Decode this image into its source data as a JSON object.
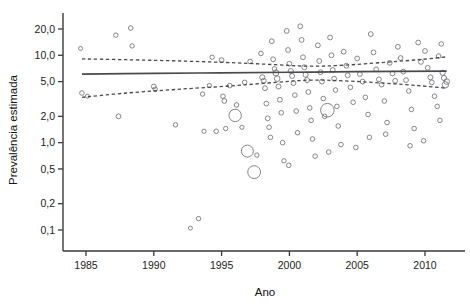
{
  "chart_data": {
    "type": "scatter",
    "title": "",
    "subtitle": "",
    "xlabel": "Ano",
    "ylabel": "Prevalência estimada",
    "yscale": "log",
    "xscale": "linear",
    "xlim": [
      1984.0,
      1984.0
    ],
    "ylim": [
      0.07,
      26.0
    ],
    "grid": false,
    "legend": null,
    "legend_position": "none",
    "xticks": [
      1985,
      1990,
      1995,
      2000,
      2005,
      2010
    ],
    "xticklabels": [
      "1985",
      "1990",
      "1995",
      "2000",
      "2005",
      "2010"
    ],
    "yticks": [
      20.0,
      10.0,
      5.0,
      2.0,
      1.0,
      0.5,
      0.2,
      0.1
    ],
    "yticklabels": [
      "20,0",
      "10,0",
      "5,0",
      "2,0",
      "1,0",
      "0,5",
      "0,2",
      "0,1"
    ],
    "marker": "open-circle",
    "marker_color": "#6f7077",
    "annotations": [],
    "points": [
      {
        "x": 1984.6,
        "y": 12.0,
        "r": 2.0
      },
      {
        "x": 1984.7,
        "y": 3.7,
        "r": 2.3
      },
      {
        "x": 1985.1,
        "y": 3.4,
        "r": 2.0
      },
      {
        "x": 1987.2,
        "y": 17.0,
        "r": 2.2
      },
      {
        "x": 1987.4,
        "y": 2.0,
        "r": 2.4
      },
      {
        "x": 1988.3,
        "y": 20.5,
        "r": 2.3
      },
      {
        "x": 1988.4,
        "y": 12.8,
        "r": 2.2
      },
      {
        "x": 1990.0,
        "y": 4.4,
        "r": 2.4
      },
      {
        "x": 1990.1,
        "y": 4.1,
        "r": 2.2
      },
      {
        "x": 1991.6,
        "y": 1.6,
        "r": 2.2
      },
      {
        "x": 1992.7,
        "y": 0.105,
        "r": 2.0
      },
      {
        "x": 1993.3,
        "y": 0.135,
        "r": 2.2
      },
      {
        "x": 1993.6,
        "y": 3.6,
        "r": 2.2
      },
      {
        "x": 1993.7,
        "y": 1.35,
        "r": 2.1
      },
      {
        "x": 1994.1,
        "y": 4.5,
        "r": 2.2
      },
      {
        "x": 1994.6,
        "y": 1.35,
        "r": 2.3
      },
      {
        "x": 1995.0,
        "y": 8.8,
        "r": 2.4
      },
      {
        "x": 1995.1,
        "y": 3.4,
        "r": 2.3
      },
      {
        "x": 1995.2,
        "y": 3.0,
        "r": 2.4
      },
      {
        "x": 1995.3,
        "y": 1.45,
        "r": 2.2
      },
      {
        "x": 1995.6,
        "y": 4.5,
        "r": 2.3
      },
      {
        "x": 1996.0,
        "y": 2.05,
        "r": 6.2
      },
      {
        "x": 1996.1,
        "y": 2.7,
        "r": 2.3
      },
      {
        "x": 1996.5,
        "y": 1.5,
        "r": 2.1
      },
      {
        "x": 1996.9,
        "y": 0.8,
        "r": 6.0
      },
      {
        "x": 1997.1,
        "y": 8.5,
        "r": 2.3
      },
      {
        "x": 1997.4,
        "y": 0.46,
        "r": 6.4
      },
      {
        "x": 1997.6,
        "y": 0.72,
        "r": 2.2
      },
      {
        "x": 1997.9,
        "y": 10.5,
        "r": 2.3
      },
      {
        "x": 1998.0,
        "y": 5.6,
        "r": 2.6
      },
      {
        "x": 1998.1,
        "y": 5.1,
        "r": 2.5
      },
      {
        "x": 1998.2,
        "y": 4.2,
        "r": 2.4
      },
      {
        "x": 1998.3,
        "y": 2.8,
        "r": 2.4
      },
      {
        "x": 1998.4,
        "y": 1.9,
        "r": 2.4
      },
      {
        "x": 1998.5,
        "y": 1.5,
        "r": 2.3
      },
      {
        "x": 1998.6,
        "y": 1.15,
        "r": 2.3
      },
      {
        "x": 1998.7,
        "y": 14.5,
        "r": 2.4
      },
      {
        "x": 1998.8,
        "y": 9.0,
        "r": 2.4
      },
      {
        "x": 1998.9,
        "y": 7.0,
        "r": 2.3
      },
      {
        "x": 1999.0,
        "y": 6.3,
        "r": 3.0
      },
      {
        "x": 1999.1,
        "y": 5.4,
        "r": 2.8
      },
      {
        "x": 1999.2,
        "y": 4.4,
        "r": 2.5
      },
      {
        "x": 1999.3,
        "y": 3.1,
        "r": 2.4
      },
      {
        "x": 1999.4,
        "y": 2.2,
        "r": 2.3
      },
      {
        "x": 1999.5,
        "y": 1.0,
        "r": 2.3
      },
      {
        "x": 1999.6,
        "y": 0.62,
        "r": 2.2
      },
      {
        "x": 1999.8,
        "y": 19.0,
        "r": 2.4
      },
      {
        "x": 1999.9,
        "y": 11.5,
        "r": 2.4
      },
      {
        "x": 2000.0,
        "y": 8.0,
        "r": 2.4
      },
      {
        "x": 2000.1,
        "y": 6.6,
        "r": 2.6
      },
      {
        "x": 2000.2,
        "y": 5.8,
        "r": 2.5
      },
      {
        "x": 2000.3,
        "y": 4.8,
        "r": 2.4
      },
      {
        "x": 2000.4,
        "y": 3.5,
        "r": 2.3
      },
      {
        "x": 2000.5,
        "y": 2.3,
        "r": 2.3
      },
      {
        "x": 2000.6,
        "y": 1.3,
        "r": 2.3
      },
      {
        "x": 2000.8,
        "y": 21.5,
        "r": 2.4
      },
      {
        "x": 2000.9,
        "y": 15.0,
        "r": 2.4
      },
      {
        "x": 2001.0,
        "y": 9.5,
        "r": 2.4
      },
      {
        "x": 2001.1,
        "y": 7.3,
        "r": 2.5
      },
      {
        "x": 2001.2,
        "y": 6.0,
        "r": 2.5
      },
      {
        "x": 2001.3,
        "y": 5.2,
        "r": 2.5
      },
      {
        "x": 2001.4,
        "y": 3.8,
        "r": 2.4
      },
      {
        "x": 2001.5,
        "y": 2.5,
        "r": 2.3
      },
      {
        "x": 2001.6,
        "y": 1.8,
        "r": 2.3
      },
      {
        "x": 2001.7,
        "y": 1.1,
        "r": 2.3
      },
      {
        "x": 2002.1,
        "y": 13.0,
        "r": 2.4
      },
      {
        "x": 2002.2,
        "y": 8.6,
        "r": 2.4
      },
      {
        "x": 2002.3,
        "y": 6.4,
        "r": 2.4
      },
      {
        "x": 2002.4,
        "y": 5.0,
        "r": 2.4
      },
      {
        "x": 2002.5,
        "y": 3.2,
        "r": 2.3
      },
      {
        "x": 2002.6,
        "y": 2.0,
        "r": 2.3
      },
      {
        "x": 2002.8,
        "y": 2.35,
        "r": 6.8
      },
      {
        "x": 2003.0,
        "y": 16.0,
        "r": 2.4
      },
      {
        "x": 2003.1,
        "y": 10.0,
        "r": 2.4
      },
      {
        "x": 2003.2,
        "y": 6.8,
        "r": 2.4
      },
      {
        "x": 2003.3,
        "y": 5.4,
        "r": 2.4
      },
      {
        "x": 2003.4,
        "y": 4.0,
        "r": 2.3
      },
      {
        "x": 2003.5,
        "y": 2.6,
        "r": 2.3
      },
      {
        "x": 2003.6,
        "y": 1.55,
        "r": 2.3
      },
      {
        "x": 2003.8,
        "y": 0.95,
        "r": 2.3
      },
      {
        "x": 2004.0,
        "y": 11.0,
        "r": 2.4
      },
      {
        "x": 2004.2,
        "y": 7.6,
        "r": 2.4
      },
      {
        "x": 2004.3,
        "y": 5.9,
        "r": 2.4
      },
      {
        "x": 2004.5,
        "y": 4.3,
        "r": 2.3
      },
      {
        "x": 2004.7,
        "y": 2.9,
        "r": 2.3
      },
      {
        "x": 2005.0,
        "y": 9.2,
        "r": 2.4
      },
      {
        "x": 2005.2,
        "y": 6.1,
        "r": 2.4
      },
      {
        "x": 2005.4,
        "y": 5.0,
        "r": 2.4
      },
      {
        "x": 2005.6,
        "y": 3.3,
        "r": 2.3
      },
      {
        "x": 2005.8,
        "y": 2.1,
        "r": 2.3
      },
      {
        "x": 2006.0,
        "y": 17.5,
        "r": 2.4
      },
      {
        "x": 2006.2,
        "y": 10.8,
        "r": 2.4
      },
      {
        "x": 2006.4,
        "y": 6.9,
        "r": 2.4
      },
      {
        "x": 2006.6,
        "y": 5.3,
        "r": 2.4
      },
      {
        "x": 2006.8,
        "y": 4.6,
        "r": 2.3
      },
      {
        "x": 2007.0,
        "y": 3.0,
        "r": 2.3
      },
      {
        "x": 2007.2,
        "y": 1.7,
        "r": 2.3
      },
      {
        "x": 2007.4,
        "y": 8.2,
        "r": 2.4
      },
      {
        "x": 2007.6,
        "y": 6.2,
        "r": 2.4
      },
      {
        "x": 2007.8,
        "y": 5.1,
        "r": 2.4
      },
      {
        "x": 2008.0,
        "y": 12.5,
        "r": 2.4
      },
      {
        "x": 2008.2,
        "y": 9.3,
        "r": 2.4
      },
      {
        "x": 2008.4,
        "y": 6.5,
        "r": 2.4
      },
      {
        "x": 2008.6,
        "y": 5.2,
        "r": 2.4
      },
      {
        "x": 2008.8,
        "y": 3.9,
        "r": 2.3
      },
      {
        "x": 2009.0,
        "y": 2.4,
        "r": 2.3
      },
      {
        "x": 2009.2,
        "y": 1.45,
        "r": 2.3
      },
      {
        "x": 2009.5,
        "y": 14.0,
        "r": 2.4
      },
      {
        "x": 2009.7,
        "y": 8.4,
        "r": 2.4
      },
      {
        "x": 2010.0,
        "y": 11.2,
        "r": 2.4
      },
      {
        "x": 2010.2,
        "y": 7.2,
        "r": 2.4
      },
      {
        "x": 2010.4,
        "y": 5.6,
        "r": 2.5
      },
      {
        "x": 2010.5,
        "y": 4.9,
        "r": 2.4
      },
      {
        "x": 2010.7,
        "y": 3.4,
        "r": 2.3
      },
      {
        "x": 2010.9,
        "y": 2.6,
        "r": 2.3
      },
      {
        "x": 2011.1,
        "y": 1.8,
        "r": 2.3
      },
      {
        "x": 2011.3,
        "y": 6.3,
        "r": 2.6
      },
      {
        "x": 2011.4,
        "y": 5.5,
        "r": 2.6
      },
      {
        "x": 2011.5,
        "y": 4.6,
        "r": 3.2
      },
      {
        "x": 2011.6,
        "y": 5.0,
        "r": 2.8
      },
      {
        "x": 2011.2,
        "y": 13.5,
        "r": 2.3
      },
      {
        "x": 2011.0,
        "y": 9.8,
        "r": 2.3
      },
      {
        "x": 2009.9,
        "y": 1.05,
        "r": 2.3
      },
      {
        "x": 2008.9,
        "y": 0.92,
        "r": 2.3
      },
      {
        "x": 2007.1,
        "y": 1.25,
        "r": 2.3
      },
      {
        "x": 2005.9,
        "y": 1.15,
        "r": 2.3
      },
      {
        "x": 2004.9,
        "y": 0.88,
        "r": 2.3
      },
      {
        "x": 2002.9,
        "y": 0.78,
        "r": 2.3
      },
      {
        "x": 2001.9,
        "y": 0.7,
        "r": 2.3
      },
      {
        "x": 1999.95,
        "y": 0.55,
        "r": 2.3
      },
      {
        "x": 1996.7,
        "y": 4.9,
        "r": 2.3
      },
      {
        "x": 1994.3,
        "y": 9.5,
        "r": 2.2
      }
    ],
    "fit_line": {
      "label": "Linha de tendência ajustada",
      "style": "solid",
      "points": [
        {
          "x": 1984.7,
          "y": 6.1
        },
        {
          "x": 1990.0,
          "y": 6.2
        },
        {
          "x": 1995.0,
          "y": 6.3
        },
        {
          "x": 2000.0,
          "y": 6.4
        },
        {
          "x": 2005.0,
          "y": 6.5
        },
        {
          "x": 2011.6,
          "y": 6.6
        }
      ]
    },
    "ci_upper": {
      "label": "Limite superior do intervalo de confiança",
      "style": "dashed",
      "points": [
        {
          "x": 1984.7,
          "y": 9.1
        },
        {
          "x": 1988.0,
          "y": 8.9
        },
        {
          "x": 1992.0,
          "y": 8.6
        },
        {
          "x": 1996.0,
          "y": 8.2
        },
        {
          "x": 1999.0,
          "y": 7.8
        },
        {
          "x": 2001.5,
          "y": 7.5
        },
        {
          "x": 2004.0,
          "y": 7.7
        },
        {
          "x": 2007.0,
          "y": 8.3
        },
        {
          "x": 2009.5,
          "y": 8.9
        },
        {
          "x": 2011.6,
          "y": 9.6
        }
      ]
    },
    "ci_lower": {
      "label": "Limite inferior do intervalo de confiança",
      "style": "dashed",
      "points": [
        {
          "x": 1984.7,
          "y": 3.3
        },
        {
          "x": 1988.0,
          "y": 3.7
        },
        {
          "x": 1992.0,
          "y": 4.1
        },
        {
          "x": 1996.0,
          "y": 4.5
        },
        {
          "x": 1999.0,
          "y": 4.9
        },
        {
          "x": 2001.5,
          "y": 5.2
        },
        {
          "x": 2004.0,
          "y": 5.1
        },
        {
          "x": 2007.0,
          "y": 4.8
        },
        {
          "x": 2009.5,
          "y": 4.5
        },
        {
          "x": 2011.6,
          "y": 4.2
        }
      ]
    }
  }
}
